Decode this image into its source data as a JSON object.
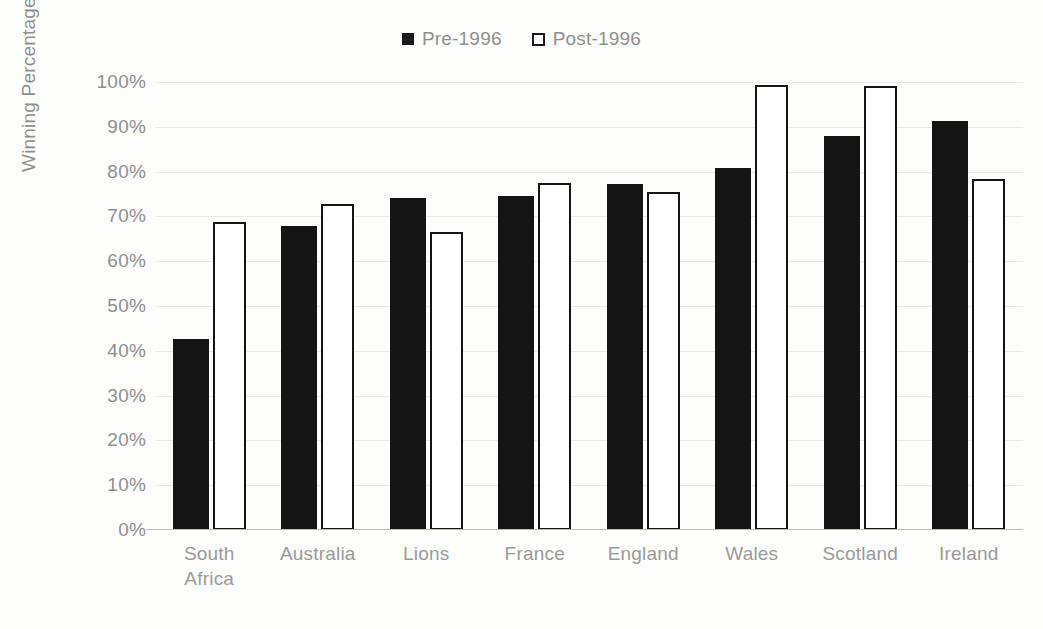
{
  "chart_data": {
    "type": "bar",
    "title": "",
    "subtitle": "",
    "xlabel": "",
    "ylabel": "Winning Percentage",
    "ylim": [
      0,
      100
    ],
    "y_tick_labels": [
      "100%",
      "90%",
      "80%",
      "70%",
      "60%",
      "50%",
      "40%",
      "30%",
      "20%",
      "10%",
      "0%"
    ],
    "y_tick_values": [
      100,
      90,
      80,
      70,
      60,
      50,
      40,
      30,
      20,
      10,
      0
    ],
    "grid": true,
    "legend_position": "top-center",
    "categories": [
      "South Africa",
      "Australia",
      "Lions",
      "France",
      "England",
      "Wales",
      "Scotland",
      "Ireland"
    ],
    "category_lines": [
      [
        "South",
        "Africa"
      ],
      [
        "Australia"
      ],
      [
        "Lions"
      ],
      [
        "France"
      ],
      [
        "England"
      ],
      [
        "Wales"
      ],
      [
        "Scotland"
      ],
      [
        "Ireland"
      ]
    ],
    "series": [
      {
        "name": "Pre-1996",
        "marker": "filled-square",
        "color": "#141414",
        "values": [
          42.6,
          67.8,
          74.0,
          74.5,
          77.2,
          80.7,
          88.0,
          91.4
        ]
      },
      {
        "name": "Post-1996",
        "marker": "hollow-square",
        "color": "#ffffff",
        "border_color": "#141414",
        "values": [
          68.8,
          72.7,
          66.6,
          77.4,
          75.5,
          99.4,
          99.2,
          78.4
        ]
      }
    ],
    "value_unit": "%"
  },
  "legend": {
    "items": [
      {
        "label": "Pre-1996",
        "marker": "filled-square"
      },
      {
        "label": "Post-1996",
        "marker": "hollow-square"
      }
    ]
  },
  "colors": {
    "series_pre": "#141414",
    "series_post": "#ffffff",
    "series_post_border": "#141414",
    "text": "#8f8f8f",
    "gridline": "#e9e9e6",
    "axis": "#bdbdbd",
    "background": "#fdfdfb"
  }
}
